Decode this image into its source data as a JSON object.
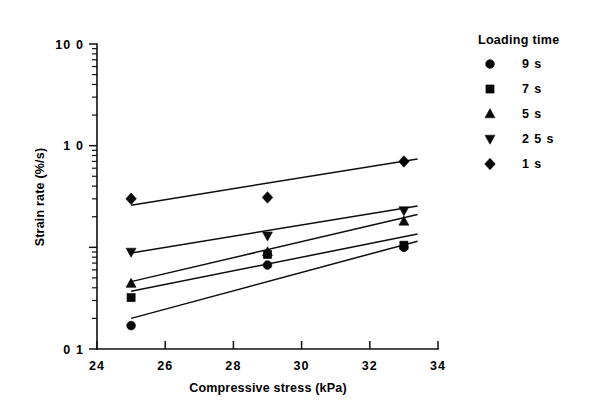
{
  "chart_data": {
    "type": "scatter",
    "title": "",
    "xlabel": "Compressive stress (kPa)",
    "ylabel": "Strain rate (%/s)",
    "xlim": [
      24,
      34
    ],
    "ylim": [
      0.1,
      100
    ],
    "yscale": "log",
    "xscale": "linear",
    "grid": false,
    "legend_position": "right",
    "legend_title": "Loading time",
    "x_ticks": [
      "24",
      "26",
      "28",
      "30",
      "32",
      "34"
    ],
    "x_tick_values": [
      24,
      26,
      28,
      30,
      32,
      34
    ],
    "y_ticks": [
      "0 1",
      "1 0",
      "10 0"
    ],
    "y_tick_values": [
      0.1,
      10,
      100
    ],
    "series": [
      {
        "name": "9 s",
        "marker": "circle",
        "x": [
          25,
          29,
          33
        ],
        "values": [
          0.17,
          0.67,
          1.0
        ],
        "fit_line": {
          "x0": 25,
          "y0": 0.2,
          "x1": 33.4,
          "y1": 1.15
        }
      },
      {
        "name": "7 s",
        "marker": "square",
        "x": [
          25,
          29,
          33
        ],
        "values": [
          0.32,
          0.85,
          1.05
        ],
        "fit_line": {
          "x0": 25,
          "y0": 0.37,
          "x1": 33.4,
          "y1": 1.35
        }
      },
      {
        "name": "5 s",
        "marker": "triangle-up",
        "x": [
          25,
          29,
          33
        ],
        "values": [
          0.44,
          0.9,
          1.8
        ],
        "fit_line": {
          "x0": 25,
          "y0": 0.46,
          "x1": 33.4,
          "y1": 2.1
        }
      },
      {
        "name": "2 5 s",
        "marker": "triangle-down",
        "x": [
          25,
          29,
          33
        ],
        "values": [
          0.9,
          1.3,
          2.3
        ],
        "fit_line": {
          "x0": 25,
          "y0": 0.88,
          "x1": 33.4,
          "y1": 2.55
        }
      },
      {
        "name": "1 s",
        "marker": "diamond",
        "x": [
          25,
          29,
          33
        ],
        "values": [
          3.0,
          3.1,
          7.0
        ],
        "fit_line": {
          "x0": 25,
          "y0": 2.6,
          "x1": 33.4,
          "y1": 7.4
        }
      }
    ]
  },
  "axes": {
    "y_label": "Strain rate (%/s)",
    "x_label": "Compressive stress (kPa)",
    "y_tick_labels": [
      "10 0",
      "1 0",
      "0 1"
    ],
    "x_tick_labels": [
      "24",
      "26",
      "28",
      "30",
      "32",
      "34"
    ]
  },
  "legend": {
    "title": "Loading time",
    "items": [
      {
        "marker": "circle",
        "label": "9 s"
      },
      {
        "marker": "square",
        "label": "7 s"
      },
      {
        "marker": "triangle-up",
        "label": "5 s"
      },
      {
        "marker": "triangle-down",
        "label": "2 5 s"
      },
      {
        "marker": "diamond",
        "label": "1 s"
      }
    ]
  },
  "colors": {
    "marker": "#080808",
    "line": "#0d0d0d",
    "axis": "#111111",
    "background": "#ffffff"
  }
}
